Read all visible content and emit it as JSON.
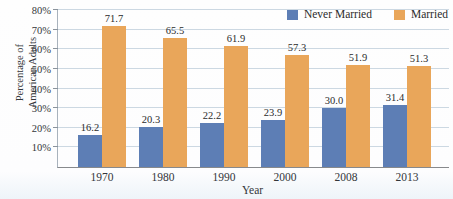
{
  "figure": {
    "y_axis_title_line1": "Percentage of",
    "y_axis_title_line2": "American Adults",
    "x_axis_title": "Year"
  },
  "colors": {
    "never_married_bar": "#5d7eb5",
    "married_bar": "#e9a65a",
    "grid_line": "#ccd8e2",
    "axis_line": "#87898c",
    "text": "#2e2e2e"
  },
  "chart_data": {
    "type": "bar",
    "title": "",
    "categories": [
      "1970",
      "1980",
      "1990",
      "2000",
      "2008",
      "2013"
    ],
    "series": [
      {
        "name": "Never Married",
        "color": "#5d7eb5",
        "values": [
          16.2,
          20.3,
          22.2,
          23.9,
          30.0,
          31.4
        ]
      },
      {
        "name": "Married",
        "color": "#e9a65a",
        "values": [
          71.7,
          65.5,
          61.9,
          57.3,
          51.9,
          51.3
        ]
      }
    ],
    "xlabel": "Year",
    "ylabel": "Percentage of American Adults",
    "ylim": [
      0,
      80
    ],
    "ytick_step": 10,
    "ytick_labels": [
      "10%",
      "20%",
      "30%",
      "40%",
      "50%",
      "60%",
      "70%",
      "80%"
    ],
    "grid": true,
    "legend_position": "top-right",
    "value_labels": true,
    "value_label_decimals": 1
  }
}
